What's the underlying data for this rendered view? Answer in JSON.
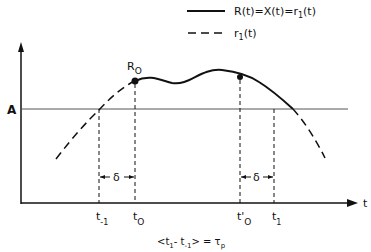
{
  "legend": {
    "solid_label": "R(t)=X(t)=r",
    "solid_sub": "1",
    "solid_tail": "(t)",
    "dashed_label": "r",
    "dashed_sub": "1",
    "dashed_tail": "(t)"
  },
  "labels": {
    "peak": "R",
    "peak_sub": "O",
    "threshold": "A",
    "axis_t": "t",
    "delta_left": "δ",
    "delta_right": "δ",
    "t_minus1": "t",
    "t_minus1_sub": "-1",
    "t0": "t",
    "t0_sub": "O",
    "t0_prime": "t'",
    "t0_prime_sub": "O",
    "t1": "t",
    "t1_sub": "1"
  },
  "formula": {
    "text": "<t",
    "sub1": "1",
    "mid": "- t",
    "sub2": "-1",
    "tail": "> = τ",
    "sub3": "p"
  },
  "colors": {
    "ink": "#111111",
    "threshold": "#555555"
  }
}
